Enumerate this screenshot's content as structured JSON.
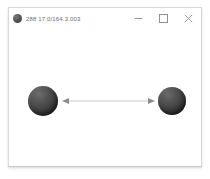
{
  "window": {
    "title": "288 17.0/164.3.003",
    "icon": "sphere-icon",
    "background_color": "#ffffff",
    "border_color": "#d9d9d9"
  },
  "title_bar": {
    "controls": [
      {
        "name": "minimize",
        "glyph": "─",
        "label": "Minimize"
      },
      {
        "name": "maximize",
        "glyph": "□",
        "label": "Maximize"
      },
      {
        "name": "close",
        "glyph": "✕",
        "label": "Close"
      }
    ]
  },
  "canvas": {
    "background_color": "#ffffff",
    "objects": [
      {
        "name": "sphere-left",
        "shape": "sphere",
        "color": "#3f3f3f",
        "center": [
          34,
          93
        ],
        "diameter": 30
      },
      {
        "name": "sphere-right",
        "shape": "sphere",
        "color": "#3e3e3e",
        "center": [
          163,
          92
        ],
        "diameter": 28
      },
      {
        "name": "connector-arrow",
        "shape": "double-headed-arrow",
        "color": "#b4b4b4",
        "from": [
          60,
          93
        ],
        "to": [
          147,
          93
        ]
      }
    ]
  }
}
